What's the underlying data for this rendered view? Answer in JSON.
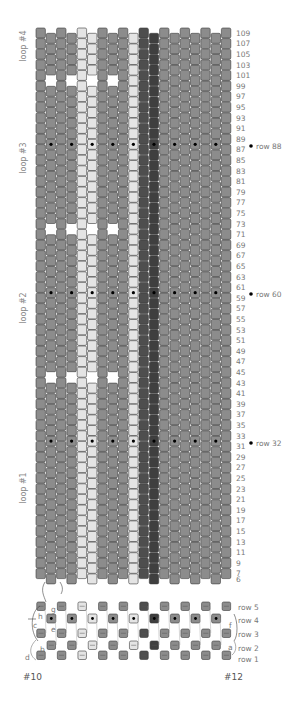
{
  "diagram": {
    "grid": {
      "columns": 19,
      "row_min": 6,
      "row_max": 109,
      "column_colors": [
        "gray",
        "gray",
        "gray",
        "gray",
        "light",
        "light",
        "gray",
        "gray",
        "gray",
        "light",
        "dark",
        "darker",
        "gray",
        "gray",
        "gray",
        "gray",
        "gray",
        "gray",
        "gray"
      ],
      "colors": {
        "gray": "#8c8c8c",
        "light": "#e4e4e4",
        "dark": "#4e4e4e",
        "darker": "#3f3f3f",
        "outline": "#3a3a3a",
        "gap": "#ffffff",
        "dot": "#000000"
      },
      "gap_rows": [
        100,
        72,
        44
      ],
      "gap_columns": [
        2,
        4,
        6,
        8,
        11,
        13,
        15,
        17
      ],
      "dot_rows": [
        88,
        60,
        32
      ],
      "dot_columns": [
        2,
        4,
        6,
        8,
        10,
        12,
        14,
        16,
        18
      ]
    },
    "row_labels": [
      "109",
      "107",
      "105",
      "103",
      "101",
      "99",
      "97",
      "95",
      "93",
      "91",
      "89",
      "87",
      "85",
      "83",
      "81",
      "79",
      "77",
      "75",
      "73",
      "71",
      "69",
      "67",
      "65",
      "63",
      "61",
      "59",
      "57",
      "55",
      "53",
      "51",
      "49",
      "47",
      "45",
      "43",
      "41",
      "39",
      "37",
      "35",
      "33",
      "31",
      "29",
      "27",
      "25",
      "23",
      "21",
      "19",
      "17",
      "15",
      "13",
      "11",
      "9",
      "7",
      "6"
    ],
    "loop_labels": [
      {
        "label": "loop #4"
      },
      {
        "label": "loop #3"
      },
      {
        "label": "loop #2"
      },
      {
        "label": "loop #1"
      }
    ],
    "markers": [
      {
        "label": "row 88"
      },
      {
        "label": "row 60"
      },
      {
        "label": "row 32"
      }
    ],
    "detail": {
      "row_labels": [
        "row 5",
        "row 4",
        "row 3",
        "row 2",
        "row 1"
      ],
      "thread_letters": [
        "g",
        "h",
        "c",
        "e",
        "b",
        "d",
        "a",
        "f"
      ],
      "left_label": "#10",
      "right_label": "#12"
    }
  }
}
